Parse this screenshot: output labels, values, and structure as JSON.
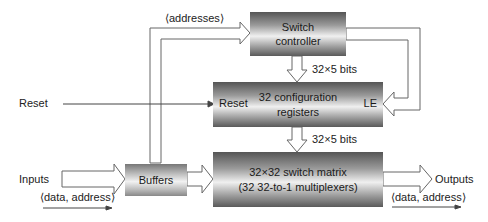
{
  "diagram": {
    "type": "block-diagram",
    "blocks": {
      "switch_controller": {
        "line1": "Switch",
        "line2": "controller"
      },
      "config_registers": {
        "line1": "32 configuration",
        "line2": "registers",
        "reset_port": "Reset",
        "le_port": "LE"
      },
      "switch_matrix": {
        "line1": "32×32 switch matrix",
        "line2": "(32 32-to-1 multiplexers)"
      },
      "buffers": {
        "label": "Buffers"
      }
    },
    "labels": {
      "addresses": "⟨addresses⟩",
      "reset": "Reset",
      "inputs": "Inputs",
      "inputs_sub": "⟨data, address⟩",
      "outputs": "Outputs",
      "outputs_sub": "⟨data, address⟩",
      "bits_top": "32×5 bits",
      "bits_bottom": "32×5 bits"
    },
    "colors": {
      "line": "#555555",
      "fill_white": "#ffffff"
    }
  }
}
